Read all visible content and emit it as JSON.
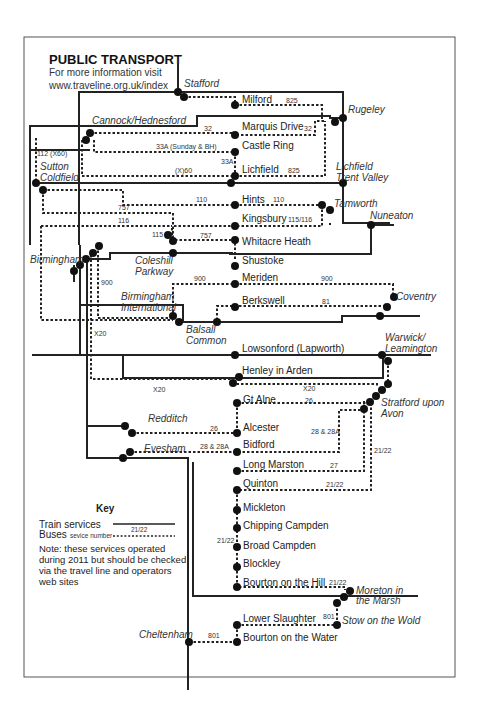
{
  "header": {
    "title": "PUBLIC TRANSPORT",
    "subtitle_line1": "For more information visit",
    "subtitle_line2": "www.traveline.org.uk/index"
  },
  "rail_stations": {
    "stafford": "Stafford",
    "cannock": "Cannock/Hednesford",
    "rugeley": "Rugeley",
    "sutton_1": "Sutton",
    "sutton_2": "Coldfield",
    "lichfield_tv_1": "Lichfield",
    "lichfield_tv_2": "Trent Valley",
    "tamworth": "Tamworth",
    "nuneaton": "Nuneaton",
    "birmingham": "Birmingham",
    "coleshill_1": "Coleshill",
    "coleshill_2": "Parkway",
    "bham_int_1": "Birmingham",
    "bham_int_2": "International",
    "coventry": "Coventry",
    "balsall_1": "Balsall",
    "balsall_2": "Common",
    "warwick_1": "Warwick/",
    "warwick_2": "Leamington",
    "stratford_1": "Stratford upon",
    "stratford_2": "Avon",
    "redditch": "Redditch",
    "evesham": "Evesham",
    "moreton_1": "Moreton in",
    "moreton_2": "the Marsh",
    "stow": "Stow on the Wold",
    "cheltenham": "Cheltenham"
  },
  "bus_stops": {
    "milford": "Milford",
    "marquis_drive": "Marquis Drive",
    "castle_ring": "Castle Ring",
    "lichfield": "Lichfield",
    "hints": "Hints",
    "kingsbury": "Kingsbury",
    "whitacre_heath": "Whitacre Heath",
    "shustoke": "Shustoke",
    "meriden": "Meriden",
    "berkswell": "Berkswell",
    "lowsonford": "Lowsonford (Lapworth)",
    "henley": "Henley in Arden",
    "gt_alne": "Gt Alne",
    "alcester": "Alcester",
    "bidford": "Bidford",
    "long_marston": "Long Marston",
    "quinton": "Quinton",
    "mickleton": "Mickleton",
    "chipping_campden": "Chipping Campden",
    "broad_campden": "Broad Campden",
    "blockley": "Blockley",
    "bourton_hill": "Bourton on the Hill",
    "lower_slaughter": "Lower Slaughter",
    "bourton_water": "Bourton on the Water"
  },
  "service_numbers": {
    "milford": "825",
    "marquis_a": "32",
    "marquis_b": "32",
    "castle_ring": "33A (Sunday & BH)",
    "castle_ring_v": "33A",
    "lichfield_x60": "(X)60",
    "lichfield_825": "825",
    "sutton_112": "112 (X60)",
    "hints_a": "110",
    "hints_b": "110",
    "kingsbury": "115/116",
    "r757_a": "757",
    "r116": "116",
    "r115": "115",
    "r757_b": "757",
    "r900_v": "900",
    "meriden_900": "900",
    "coventry_900": "900",
    "berkswell_81": "81",
    "x20_v": "X20",
    "x20_h": "X20",
    "x20_r": "X20",
    "gt_alne_26": "26",
    "redditch_26": "26",
    "evesham_28": "28 & 28A",
    "bidford_28": "28 & 28A",
    "stratford_2122": "21/22",
    "long_marston_27": "27",
    "quinton_2122": "21/22",
    "chipping_2122": "21/22",
    "bourton_hill_2122": "21/22",
    "stow_801": "801",
    "cheltenham_801": "801"
  },
  "key": {
    "title": "Key",
    "train_label": "Train services",
    "bus_label": "Buses",
    "bus_sub": "sevice number",
    "sample_number": "21/22",
    "note_line1": "Note: these services operated",
    "note_line2": "during 2011 but should be checked",
    "note_line3": "via the travel line and operators",
    "note_line4": "web sites"
  }
}
